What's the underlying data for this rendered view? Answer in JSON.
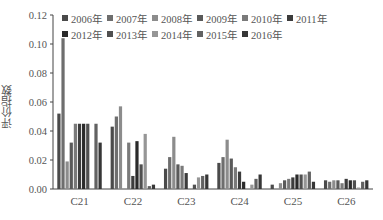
{
  "chart_data": {
    "type": "bar",
    "title": "",
    "xlabel": "",
    "ylabel": "评价指数",
    "ylim": [
      0,
      0.12
    ],
    "yticks": [
      "0.00",
      "0.02",
      "0.04",
      "0.06",
      "0.08",
      "0.10",
      "0.12"
    ],
    "grid": false,
    "legend_position": "top-inside",
    "categories": [
      "C21",
      "C22",
      "C23",
      "C24",
      "C25",
      "C26"
    ],
    "series": [
      {
        "name": "2006年",
        "color": "#4a4a4a",
        "values": [
          0.052,
          0.043,
          0.014,
          0.018,
          0.003,
          0.006
        ]
      },
      {
        "name": "2007年",
        "color": "#6e6e6e",
        "values": [
          0.104,
          0.05,
          0.022,
          0.022,
          0.0,
          0.005
        ]
      },
      {
        "name": "2008年",
        "color": "#8c8c8c",
        "values": [
          0.019,
          0.057,
          0.036,
          0.034,
          0.004,
          0.006
        ]
      },
      {
        "name": "2009年",
        "color": "#5a5a5a",
        "values": [
          0.032,
          0.0,
          0.017,
          0.021,
          0.006,
          0.006
        ]
      },
      {
        "name": "2010年",
        "color": "#7a7a7a",
        "values": [
          0.045,
          0.032,
          0.016,
          0.015,
          0.007,
          0.004
        ]
      },
      {
        "name": "2011年",
        "color": "#3c3c3c",
        "values": [
          0.045,
          0.009,
          0.011,
          0.012,
          0.008,
          0.007
        ]
      },
      {
        "name": "2012年",
        "color": "#2a2a2a",
        "values": [
          0.045,
          0.033,
          0.0,
          0.005,
          0.01,
          0.006
        ]
      },
      {
        "name": "2013年",
        "color": "#505050",
        "values": [
          0.045,
          0.017,
          0.003,
          0.0,
          0.01,
          0.006
        ]
      },
      {
        "name": "2014年",
        "color": "#969696",
        "values": [
          0.0,
          0.038,
          0.008,
          0.003,
          0.01,
          0.001
        ]
      },
      {
        "name": "2015年",
        "color": "#626262",
        "values": [
          0.045,
          0.002,
          0.009,
          0.007,
          0.012,
          0.005
        ]
      },
      {
        "name": "2016年",
        "color": "#363636",
        "values": [
          0.032,
          0.003,
          0.01,
          0.01,
          0.005,
          0.006
        ]
      }
    ]
  },
  "legend": {
    "row1": [
      "2006年",
      "2007年",
      "2008年",
      "2009年",
      "2010年",
      "2011年"
    ],
    "row2": [
      "2012年",
      "2013年",
      "2014年",
      "2015年",
      "2016年"
    ]
  },
  "axis": {
    "ylabel": "评价指数"
  }
}
